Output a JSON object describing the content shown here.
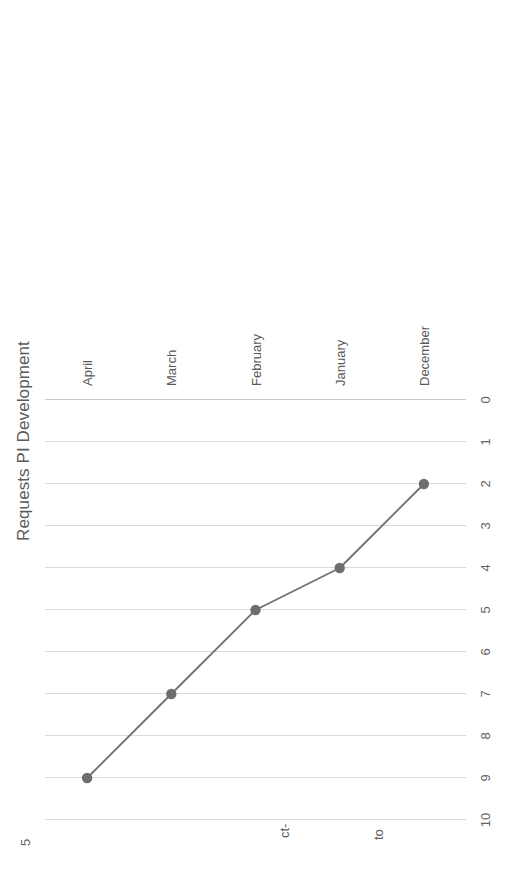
{
  "chart_data": {
    "type": "line",
    "title": "Requests PI Development",
    "xlabel": "",
    "ylabel": "",
    "categories": [
      "December",
      "January",
      "February",
      "March",
      "April"
    ],
    "values": [
      2,
      4,
      5,
      7,
      9
    ],
    "series": [
      {
        "name": "Requests PI Development",
        "values": [
          2,
          4,
          5,
          7,
          9
        ]
      }
    ],
    "ylim": [
      0,
      10
    ],
    "yticks": [
      0,
      1,
      2,
      3,
      4,
      5,
      6,
      7,
      8,
      9,
      10
    ],
    "ytick_labels": [
      "0",
      "1",
      "2",
      "3",
      "4",
      "5",
      "6",
      "7",
      "8",
      "9",
      "10"
    ],
    "grid": true,
    "legend": "none",
    "orientation": "rotated-90-ccw",
    "line_color": "#707070",
    "marker_color": "#6e6e6e",
    "gridline_color": "#d9d9d9",
    "axis_color": "#c9c9c9",
    "text_color": "#595959"
  },
  "edge_fragments": [
    {
      "text": "5",
      "note": "clipped text at bottom-left page edge"
    },
    {
      "text": "ct-",
      "note": "clipped text at bottom-center page edge"
    },
    {
      "text": "to",
      "note": "clipped text at bottom-right of center page edge"
    }
  ]
}
